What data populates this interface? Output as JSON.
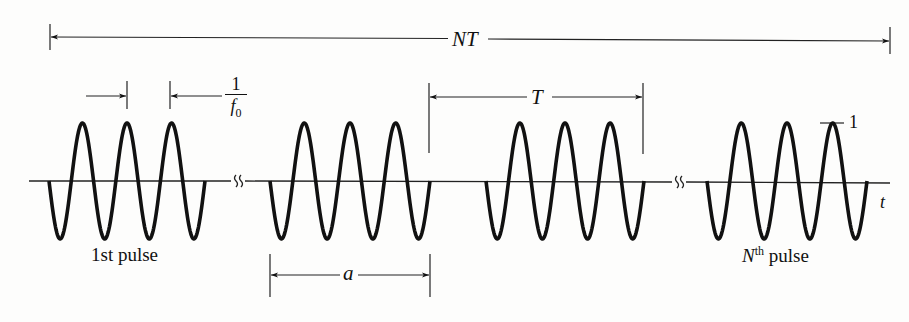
{
  "diagram": {
    "colors": {
      "ink": "#111111",
      "background": "#fdfdfc"
    },
    "total_span": {
      "label_main": "NT",
      "x_start": 50,
      "x_end": 890
    },
    "period": {
      "label": "T",
      "x_start": 429,
      "x_end": 643
    },
    "pulse_width": {
      "label": "a",
      "x_start": 270,
      "x_end": 430
    },
    "carrier_period": {
      "numerator": "1",
      "denominator_var": "f",
      "denominator_sub": "0"
    },
    "amplitude_marker": {
      "label": "1"
    },
    "axis": {
      "label": "t",
      "break_symbols": [
        "≀≀",
        "≀≀"
      ]
    },
    "pulses": [
      {
        "name": "first",
        "x_start": 49,
        "x_end": 205,
        "label": "1st pulse"
      },
      {
        "name": "second",
        "x_start": 270,
        "x_end": 430,
        "label": ""
      },
      {
        "name": "third",
        "x_start": 486,
        "x_end": 644,
        "label": ""
      },
      {
        "name": "nth",
        "x_start": 707,
        "x_end": 867,
        "label_main": "N",
        "label_sup": "th",
        "label_rest": " pulse"
      }
    ]
  }
}
